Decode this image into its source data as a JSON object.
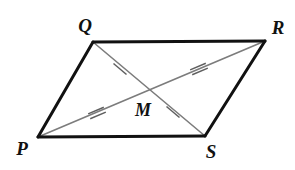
{
  "figure": {
    "name": "parallelogram-pqrs",
    "background_color": "#ffffff",
    "width": 295,
    "height": 170,
    "side_color": "#111111",
    "side_width": 3,
    "diagonal_color": "#7c7c7c",
    "diagonal_width": 1.6,
    "tick_color": "#5f5f5f",
    "tick_width": 1.5,
    "label_color": "#111111"
  },
  "vertices": [
    {
      "id": "Q",
      "label": "Q",
      "x": 93,
      "y": 42,
      "label_x": 85,
      "label_y": 25
    },
    {
      "id": "R",
      "label": "R",
      "x": 265,
      "y": 41,
      "label_x": 278,
      "label_y": 27
    },
    {
      "id": "S",
      "label": "S",
      "x": 205,
      "y": 136,
      "label_x": 211,
      "label_y": 151
    },
    {
      "id": "P",
      "label": "P",
      "x": 38,
      "y": 137,
      "label_x": 22,
      "label_y": 148
    }
  ],
  "interior_points": [
    {
      "id": "M",
      "label": "M",
      "x": 145,
      "y": 92,
      "label_x": 143,
      "label_y": 110
    }
  ],
  "sides": [
    {
      "id": "QR",
      "from": "Q",
      "to": "R",
      "x1": 93,
      "y1": 42,
      "x2": 265,
      "y2": 41
    },
    {
      "id": "RS",
      "from": "R",
      "to": "S",
      "x1": 265,
      "y1": 41,
      "x2": 205,
      "y2": 136
    },
    {
      "id": "SP",
      "from": "S",
      "to": "P",
      "x1": 205,
      "y1": 136,
      "x2": 38,
      "y2": 137
    },
    {
      "id": "PQ",
      "from": "P",
      "to": "Q",
      "x1": 38,
      "y1": 137,
      "x2": 93,
      "y2": 42
    }
  ],
  "diagonals": [
    {
      "id": "QS",
      "from": "Q",
      "to": "S",
      "x1": 93,
      "y1": 42,
      "x2": 205,
      "y2": 136
    },
    {
      "id": "PR",
      "from": "P",
      "to": "R",
      "x1": 38,
      "y1": 137,
      "x2": 265,
      "y2": 41
    }
  ],
  "tick_marks": [
    {
      "id": "tick-QM",
      "on_segment": "QM",
      "count": 1,
      "x": 120,
      "y": 69,
      "angle_deg": 40,
      "length": 17
    },
    {
      "id": "tick-MS",
      "on_segment": "MS",
      "count": 1,
      "x": 173,
      "y": 112,
      "angle_deg": 40,
      "length": 17
    },
    {
      "id": "tick-PM",
      "on_segment": "PM",
      "count": 2,
      "x": 97,
      "y": 113,
      "angle_deg": -23,
      "length": 17
    },
    {
      "id": "tick-MR",
      "on_segment": "MR",
      "count": 2,
      "x": 199,
      "y": 69,
      "angle_deg": -23,
      "length": 17
    }
  ],
  "congruence_notes": {
    "single_tick_pair": "QM = MS",
    "double_tick_pair": "PM = MR"
  }
}
